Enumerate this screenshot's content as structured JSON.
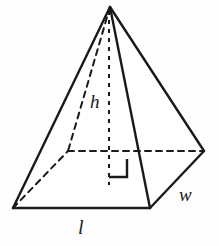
{
  "figure": {
    "kind": "rectangular-pyramid-diagram",
    "background_color": "#fefefe",
    "stroke_color": "#1a1a1a",
    "solid_stroke_width": "2.2",
    "hidden_stroke_width": "2.0",
    "hidden_dash_pattern": "6 5",
    "height_dash_pattern": "4 5",
    "labels": {
      "height": "h",
      "length": "l",
      "width": "w"
    },
    "vertices": {
      "apex": "110,7",
      "front_left": "13,208",
      "front_right": "150,208",
      "right": "204,151",
      "back_hidden": "68,151",
      "base_center": "109,151"
    },
    "edges": {
      "apex_to_front_left": "110,7 13,208",
      "apex_to_front_right": "110,7 150,208",
      "apex_to_right": "110,7 204,151",
      "apex_to_back_hidden": "110,7 68,151",
      "base_front": "13,208 150,208",
      "base_front_right": "150,208 204,151",
      "base_back_left_hidden": "13,208 68,151",
      "base_back_right_hidden": "68,151 204,151",
      "height_line": "109,10 109,185"
    },
    "right_angle_marker": {
      "path": "M 109 177 L 127 177 L 127 159",
      "size_px": "18"
    }
  }
}
